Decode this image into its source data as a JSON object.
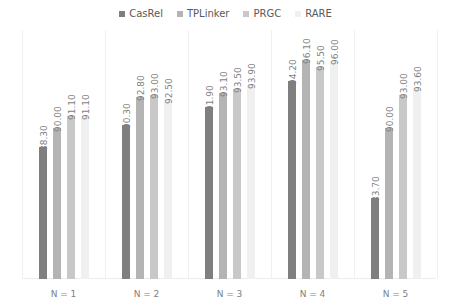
{
  "chart_data": {
    "type": "bar",
    "title": "",
    "xlabel": "",
    "ylabel": "",
    "categories": [
      "N = 1",
      "N = 2",
      "N = 3",
      "N = 4",
      "N = 5"
    ],
    "series": [
      {
        "name": "CasRel",
        "color": "#7f7f7f",
        "values": [
          88.3,
          90.3,
          91.9,
          94.2,
          83.7
        ]
      },
      {
        "name": "TPLinker",
        "color": "#b4b4b4",
        "values": [
          90.0,
          92.8,
          93.1,
          96.1,
          90.0
        ]
      },
      {
        "name": "PRGC",
        "color": "#c8c8c8",
        "values": [
          91.1,
          93.0,
          93.5,
          95.5,
          93.0
        ]
      },
      {
        "name": "RARE",
        "color": "#f0f0f0",
        "values": [
          91.1,
          92.5,
          93.9,
          96.0,
          93.6
        ]
      }
    ],
    "value_labels": [
      [
        "88.30",
        "90.30",
        "91.90",
        "94.20",
        "83.70"
      ],
      [
        "90.00",
        "92.80",
        "93.10",
        "96.10",
        "90.00"
      ],
      [
        "91.10",
        "93.00",
        "93.50",
        "95.50",
        "93.00"
      ],
      [
        "91.10",
        "92.50",
        "93.90",
        "96.00",
        "93.60"
      ]
    ],
    "legend_position": "top",
    "grid": false,
    "y_axis_visible": false,
    "ylim": [
      76.46,
      98.8
    ]
  }
}
